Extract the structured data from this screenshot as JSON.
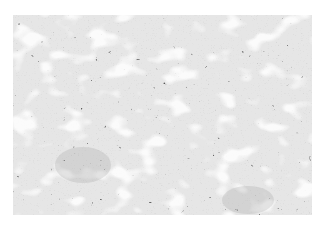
{
  "image": {
    "subject": "grayscale histology micrograph",
    "description": "Dense tissue with dark-stained cell nuclei arranged in anastomosing cords and trabeculae, separated by pale white channels/spaces; a slightly smoother gray region lower-left and lower-right.",
    "palette": {
      "background": "#ffffff",
      "tissue_light": "#e4e4e4",
      "nuclei_dark": "#3a3a3a",
      "mid_gray": "#8a8a8a"
    }
  }
}
